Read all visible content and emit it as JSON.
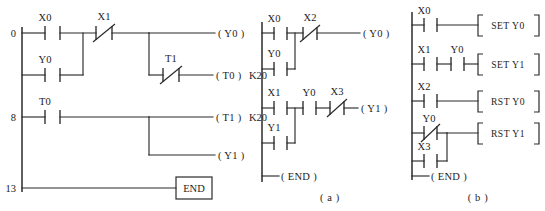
{
  "figure": {
    "captions": [
      {
        "id": "caption-a",
        "text": "( a )"
      },
      {
        "id": "caption-b",
        "text": "( b )"
      }
    ]
  },
  "diagram_left": {
    "name": "timer-ladder-program",
    "step_numbers": [
      "0",
      "8",
      "13"
    ],
    "rungs": [
      {
        "step": "0",
        "contacts": [
          {
            "label": "X0",
            "type": "no"
          },
          {
            "label": "X1",
            "type": "nc"
          }
        ],
        "branch_contacts": [
          {
            "label": "Y0",
            "type": "no"
          }
        ],
        "outputs": [
          {
            "label": "( Y0 )",
            "constant": ""
          }
        ],
        "sub_branch": {
          "contacts": [
            {
              "label": "T1",
              "type": "nc"
            }
          ],
          "output": {
            "label": "( T0 )",
            "constant": "K20"
          }
        }
      },
      {
        "step": "8",
        "contacts": [
          {
            "label": "T0",
            "type": "no"
          }
        ],
        "outputs": [
          {
            "label": "( T1 )",
            "constant": "K20"
          },
          {
            "label": "( Y1 )",
            "constant": ""
          }
        ]
      },
      {
        "step": "13",
        "contacts": [],
        "outputs": [
          {
            "label": "END",
            "constant": ""
          }
        ]
      }
    ]
  },
  "diagram_a": {
    "name": "latching-ladder-program",
    "rungs": [
      {
        "contacts": [
          {
            "label": "X0",
            "type": "no"
          },
          {
            "label": "X2",
            "type": "nc"
          }
        ],
        "branch_contacts": [
          {
            "label": "Y0",
            "type": "no"
          }
        ],
        "output": {
          "label": "( Y0 )"
        }
      },
      {
        "contacts": [
          {
            "label": "X1",
            "type": "no"
          },
          {
            "label": "Y0",
            "type": "no"
          },
          {
            "label": "X3",
            "type": "nc"
          }
        ],
        "branch_contacts": [
          {
            "label": "Y1",
            "type": "no"
          }
        ],
        "output": {
          "label": "( Y1 )"
        }
      },
      {
        "contacts": [],
        "output": {
          "label": "( END )"
        }
      }
    ]
  },
  "diagram_b": {
    "name": "set-reset-ladder-program",
    "rungs": [
      {
        "contacts": [
          {
            "label": "X0",
            "type": "no"
          }
        ],
        "instruction": {
          "op": "SET",
          "operand": "Y0"
        }
      },
      {
        "contacts": [
          {
            "label": "X1",
            "type": "no"
          },
          {
            "label": "Y0",
            "type": "no"
          }
        ],
        "instruction": {
          "op": "SET",
          "operand": "Y1"
        }
      },
      {
        "contacts": [
          {
            "label": "X2",
            "type": "no"
          }
        ],
        "instruction": {
          "op": "RST",
          "operand": "Y0"
        }
      },
      {
        "contacts": [
          {
            "label": "Y0",
            "type": "nc"
          }
        ],
        "branch_contacts": [
          {
            "label": "X3",
            "type": "no"
          }
        ],
        "instruction": {
          "op": "RST",
          "operand": "Y1"
        }
      },
      {
        "contacts": [],
        "output": {
          "label": "( END )"
        }
      }
    ]
  },
  "labels": {
    "l_step0": "0",
    "l_step8": "8",
    "l_step13": "13",
    "l_x0_a": "X0",
    "l_x1_a": "X1",
    "l_y0_a": "Y0",
    "l_t1_a": "T1",
    "l_t0_a": "T0",
    "l_coil_y0": "( Y0 )",
    "l_coil_t0": "( T0 )",
    "l_k20_t0": "K20",
    "l_coil_t1": "( T1 )",
    "l_k20_t1": "K20",
    "l_coil_y1": "( Y1 )",
    "l_end_box": "END",
    "a_x0": "X0",
    "a_x2": "X2",
    "a_y0b": "Y0",
    "a_x1": "X1",
    "a_y0c": "Y0",
    "a_x3": "X3",
    "a_y1b": "Y1",
    "a_coil_y0": "( Y0 )",
    "a_coil_y1": "( Y1 )",
    "a_end": "( END )",
    "b_x0": "X0",
    "b_x1": "X1",
    "b_y0": "Y0",
    "b_x2": "X2",
    "b_y0nc": "Y0",
    "b_x3": "X3",
    "b_set_y0": "SET  Y0",
    "b_set_y1": "SET  Y1",
    "b_rst_y0": "RST  Y0",
    "b_rst_y1": "RST  Y1",
    "b_end": "( END )",
    "cap_a": "( a )",
    "cap_b": "( b )"
  }
}
